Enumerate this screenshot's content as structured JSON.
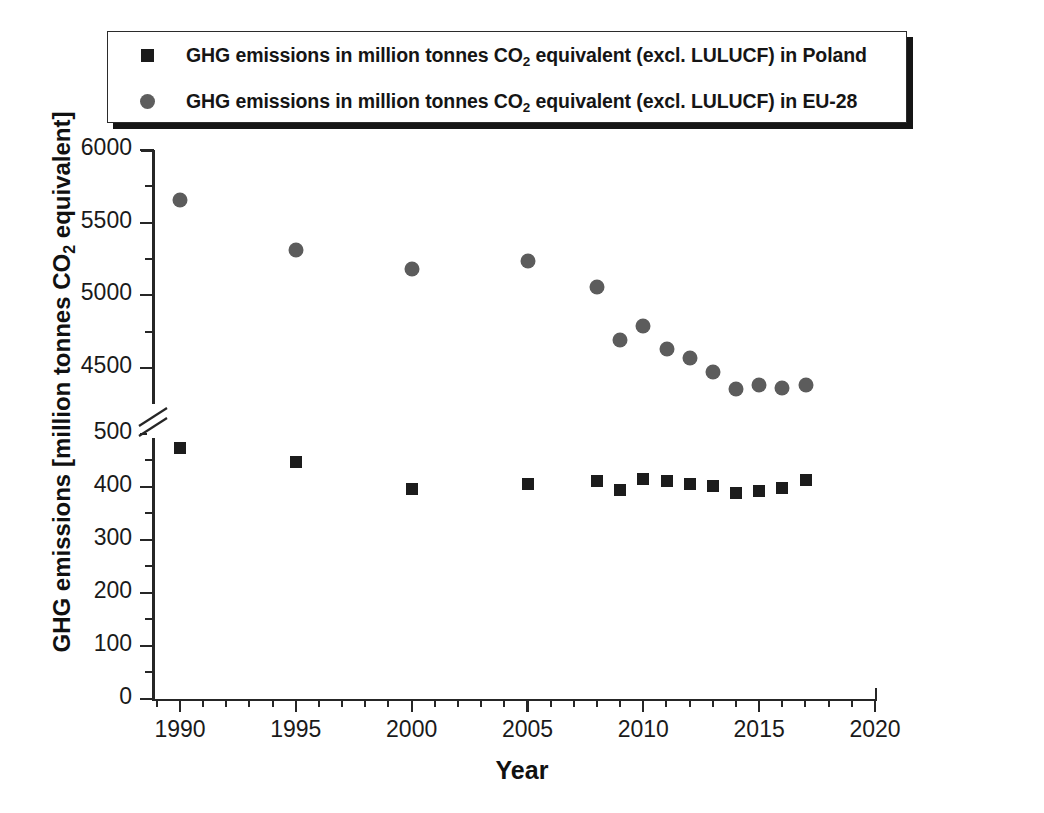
{
  "chart_data": {
    "type": "scatter",
    "title": "",
    "xlabel": "Year",
    "ylabel": "GHG emissions [million tonnes CO2 equivalent]",
    "ylabel_parts": {
      "pre": "GHG emissions [million tonnes CO",
      "sub": "2",
      "post": " equivalent]"
    },
    "xlim": [
      1988.5,
      2020
    ],
    "x_major_ticks": [
      1990,
      1995,
      2000,
      2005,
      2010,
      2015,
      2020
    ],
    "x_minor_interval": 1,
    "y_axis_broken": true,
    "y_lower_segment": {
      "range": [
        0,
        500
      ],
      "major_ticks": [
        0,
        100,
        200,
        300,
        400,
        500
      ],
      "minor_interval": 50
    },
    "y_upper_segment": {
      "range": [
        4500,
        6000
      ],
      "major_ticks": [
        4500,
        5000,
        5500,
        6000
      ],
      "minor_interval": 250
    },
    "y_tick_labels": [
      "0",
      "100",
      "200",
      "300",
      "400",
      "500",
      "4500",
      "5000",
      "5500",
      "6000"
    ],
    "grid": false,
    "legend_position": "top",
    "series": [
      {
        "name": "GHG emissions in million tonnes CO2 equivalent (excl. LULUCF) in Poland",
        "label_pre": "GHG emissions in million tonnes CO",
        "label_sub": "2",
        "label_post": " equivalent (excl. LULUCF) in Poland",
        "marker": "square",
        "color": "#1c1c1c",
        "points": [
          {
            "x": 1990,
            "y": 474
          },
          {
            "x": 1995,
            "y": 447
          },
          {
            "x": 2000,
            "y": 397
          },
          {
            "x": 2005,
            "y": 405
          },
          {
            "x": 2008,
            "y": 412
          },
          {
            "x": 2009,
            "y": 394
          },
          {
            "x": 2010,
            "y": 415
          },
          {
            "x": 2011,
            "y": 412
          },
          {
            "x": 2012,
            "y": 405
          },
          {
            "x": 2013,
            "y": 401
          },
          {
            "x": 2014,
            "y": 389
          },
          {
            "x": 2015,
            "y": 392
          },
          {
            "x": 2016,
            "y": 399
          },
          {
            "x": 2017,
            "y": 414
          }
        ]
      },
      {
        "name": "GHG emissions in million tonnes CO2 equivalent (excl. LULUCF) in EU-28",
        "label_pre": "GHG emissions in million tonnes CO",
        "label_sub": "2",
        "label_post": " equivalent (excl. LULUCF) in EU-28",
        "marker": "circle",
        "color": "#5c5c5c",
        "points": [
          {
            "x": 1990,
            "y": 5658
          },
          {
            "x": 1995,
            "y": 5314
          },
          {
            "x": 2000,
            "y": 5181
          },
          {
            "x": 2005,
            "y": 5239
          },
          {
            "x": 2008,
            "y": 5058
          },
          {
            "x": 2009,
            "y": 4692
          },
          {
            "x": 2010,
            "y": 4787
          },
          {
            "x": 2011,
            "y": 4634
          },
          {
            "x": 2012,
            "y": 4567
          },
          {
            "x": 2013,
            "y": 4470
          },
          {
            "x": 2014,
            "y": 4355
          },
          {
            "x": 2015,
            "y": 4386
          },
          {
            "x": 2016,
            "y": 4362
          },
          {
            "x": 2017,
            "y": 4385
          }
        ]
      }
    ]
  }
}
